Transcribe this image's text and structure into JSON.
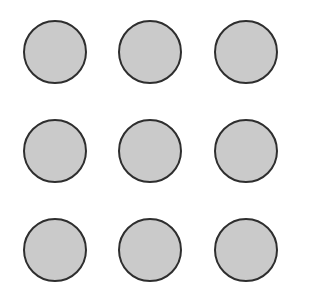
{
  "grid": {
    "rows": 3,
    "cols": 3,
    "fill_color": "#cacaca",
    "stroke_color": "#2e2e2e",
    "background": "#ffffff",
    "circles": [
      {
        "row": 0,
        "col": 0,
        "x": 23,
        "y": 20
      },
      {
        "row": 0,
        "col": 1,
        "x": 118,
        "y": 20
      },
      {
        "row": 0,
        "col": 2,
        "x": 214,
        "y": 20
      },
      {
        "row": 1,
        "col": 0,
        "x": 23,
        "y": 119
      },
      {
        "row": 1,
        "col": 1,
        "x": 118,
        "y": 119
      },
      {
        "row": 1,
        "col": 2,
        "x": 214,
        "y": 119
      },
      {
        "row": 2,
        "col": 0,
        "x": 23,
        "y": 218
      },
      {
        "row": 2,
        "col": 1,
        "x": 118,
        "y": 218
      },
      {
        "row": 2,
        "col": 2,
        "x": 214,
        "y": 218
      }
    ]
  }
}
